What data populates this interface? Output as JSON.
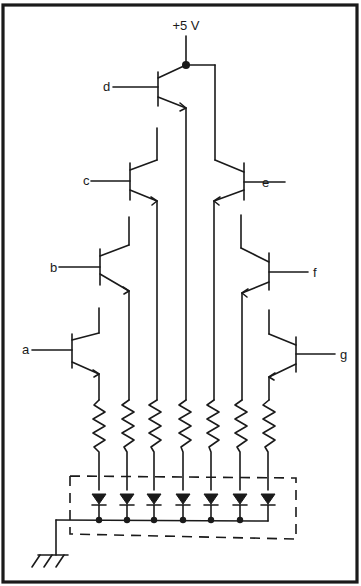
{
  "diagram": {
    "supply_label": "+5 V",
    "inputs": [
      {
        "label": "a",
        "side": "left"
      },
      {
        "label": "b",
        "side": "left"
      },
      {
        "label": "c",
        "side": "left"
      },
      {
        "label": "d",
        "side": "left"
      },
      {
        "label": "e",
        "side": "right"
      },
      {
        "label": "f",
        "side": "right"
      },
      {
        "label": "g",
        "side": "right"
      }
    ],
    "components": {
      "transistors": 7,
      "resistors": 7,
      "leds": 7,
      "ground": 1
    },
    "colors": {
      "ink": "#1a1a1a",
      "background": "#ffffff"
    }
  }
}
